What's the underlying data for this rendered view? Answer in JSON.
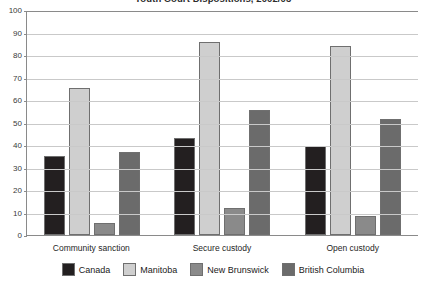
{
  "chart_data": {
    "type": "bar",
    "title": "Youth Court Dispositions, 2002/03",
    "categories": [
      "Community sanction",
      "Secure custody",
      "Open custody"
    ],
    "series": [
      {
        "name": "Canada",
        "color": "#231f20",
        "values": [
          35,
          43,
          39.5
        ]
      },
      {
        "name": "Manitoba",
        "color": "#cfcfcf",
        "values": [
          65.5,
          86,
          84
        ]
      },
      {
        "name": "New Brunswick",
        "color": "#8a8a8a",
        "values": [
          5.5,
          12,
          8.5
        ]
      },
      {
        "name": "British Columbia",
        "color": "#6b6b6b",
        "values": [
          37,
          55.5,
          51.5
        ]
      }
    ],
    "xlabel": "",
    "ylabel": "",
    "ylim": [
      0,
      100
    ],
    "ytick_values": [
      100,
      90,
      80,
      70,
      60,
      50,
      40,
      30,
      20,
      10,
      0
    ],
    "grid": true,
    "legend_position": "bottom"
  },
  "axis": {
    "y_ticks": [
      "100",
      "90",
      "80",
      "70",
      "60",
      "50",
      "40",
      "30",
      "20",
      "10",
      "0"
    ]
  },
  "legend": {
    "items": [
      {
        "label": "Canada"
      },
      {
        "label": "Manitoba"
      },
      {
        "label": "New Brunswick"
      },
      {
        "label": "British Columbia"
      }
    ]
  }
}
